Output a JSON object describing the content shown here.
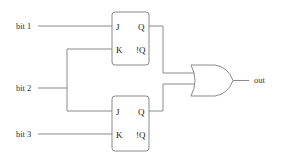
{
  "diagram": {
    "type": "logic-circuit",
    "inputs": [
      {
        "id": "bit1",
        "label": "bit 1"
      },
      {
        "id": "bit2",
        "label": "bit 2"
      },
      {
        "id": "bit3",
        "label": "bit 3"
      }
    ],
    "flipflops": [
      {
        "id": "ff_top",
        "pins": {
          "j": "J",
          "k": "K",
          "q": "Q",
          "nq": "!Q"
        }
      },
      {
        "id": "ff_bottom",
        "pins": {
          "j": "J",
          "k": "K",
          "q": "Q",
          "nq": "!Q"
        }
      }
    ],
    "gate": {
      "id": "or_gate",
      "type": "OR"
    },
    "output": {
      "id": "out",
      "label": "out"
    },
    "connections": [
      {
        "from": "bit 1",
        "to": "ff_top.J"
      },
      {
        "from": "bit 2",
        "to": "ff_top.K"
      },
      {
        "from": "bit 2",
        "to": "ff_bottom.J"
      },
      {
        "from": "bit 3",
        "to": "ff_bottom.K"
      },
      {
        "from": "ff_top.Q",
        "to": "or_gate.in1"
      },
      {
        "from": "ff_bottom.Q",
        "to": "or_gate.in2"
      },
      {
        "from": "or_gate.out",
        "to": "out"
      }
    ],
    "colors": {
      "wire": "#8a8a8a",
      "text": "#333333",
      "background": "#ffffff"
    }
  }
}
